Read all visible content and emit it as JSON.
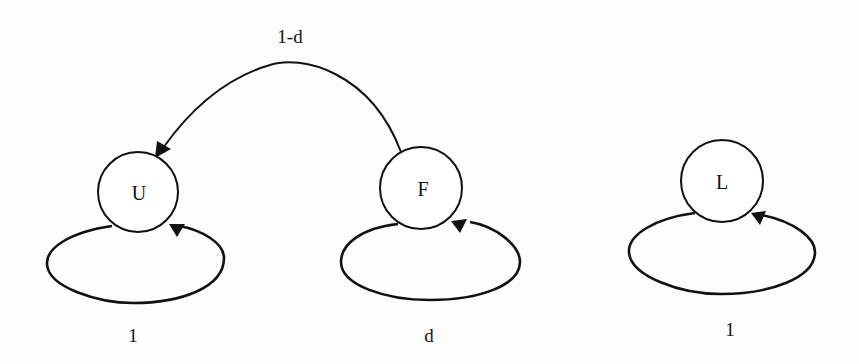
{
  "diagram": {
    "type": "state-transition",
    "nodes": [
      {
        "id": "U",
        "label": "U"
      },
      {
        "id": "F",
        "label": "F"
      },
      {
        "id": "L",
        "label": "L"
      }
    ],
    "edges": [
      {
        "from": "F",
        "to": "U",
        "label": "1-d"
      },
      {
        "from": "U",
        "to": "U",
        "label": "1"
      },
      {
        "from": "F",
        "to": "F",
        "label": "d"
      },
      {
        "from": "L",
        "to": "L",
        "label": "1"
      }
    ],
    "colors": {
      "stroke": "#111111",
      "background": "#fdfdfd"
    }
  }
}
